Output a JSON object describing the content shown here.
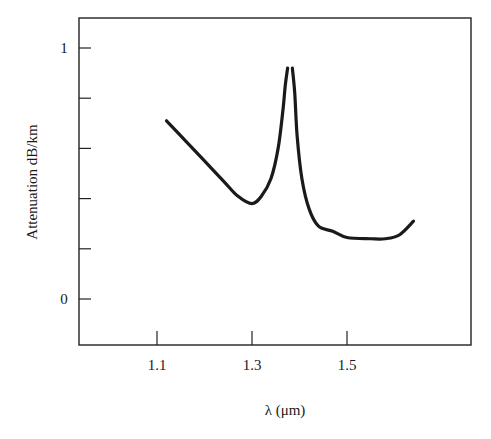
{
  "chart_data": {
    "type": "line",
    "title": "",
    "xlabel": "λ (μm)",
    "ylabel": "Attenuation dB/km",
    "xlim": [
      0.95,
      1.8
    ],
    "ylim": [
      -0.18,
      1.12
    ],
    "x_ticks": [
      1.1,
      1.3,
      1.5
    ],
    "x_tick_labels": [
      "1.1",
      "1.3",
      "1.5"
    ],
    "y_ticks": [
      0,
      0.2,
      0.4,
      0.6,
      0.8,
      1.0
    ],
    "y_tick_labels": [
      "0",
      "",
      "",
      "",
      "",
      "1"
    ],
    "grid": false,
    "legend": null,
    "series": [
      {
        "name": "attenuation",
        "segments": [
          {
            "x": [
              1.12,
              1.16,
              1.2,
              1.24,
              1.27,
              1.3,
              1.32,
              1.34,
              1.355,
              1.365,
              1.37,
              1.375
            ],
            "y": [
              0.71,
              0.63,
              0.55,
              0.47,
              0.41,
              0.38,
              0.41,
              0.48,
              0.6,
              0.75,
              0.85,
              0.92
            ]
          },
          {
            "x": [
              1.385,
              1.39,
              1.395,
              1.405,
              1.42,
              1.44,
              1.47,
              1.5,
              1.55,
              1.58,
              1.61,
              1.64
            ],
            "y": [
              0.92,
              0.82,
              0.65,
              0.48,
              0.36,
              0.29,
              0.27,
              0.245,
              0.24,
              0.24,
              0.255,
              0.31
            ]
          }
        ]
      }
    ]
  }
}
